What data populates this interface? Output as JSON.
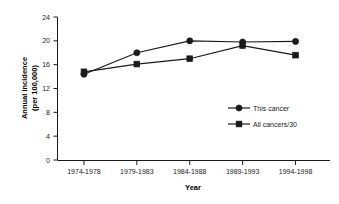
{
  "chart_data": {
    "type": "line",
    "title": "",
    "xlabel": "Year",
    "ylabel": "Annual incidence (per 100,000)",
    "ylabel_line1": "Annual incidence",
    "ylabel_line2": "(per 100,000)",
    "categories": [
      "1974-1978",
      "1979-1983",
      "1984-1988",
      "1989-1993",
      "1994-1998"
    ],
    "yticks": [
      0,
      4,
      8,
      12,
      16,
      20,
      24
    ],
    "ytick_labels": [
      "0",
      "4",
      "8",
      "12",
      "16",
      "20",
      "24"
    ],
    "ylim": [
      0,
      24
    ],
    "grid": false,
    "legend_position": "center-right",
    "series": [
      {
        "name": "This cancer",
        "marker": "circle",
        "color": "#1a1a1a",
        "values": [
          14.4,
          18.0,
          20.0,
          19.8,
          19.9
        ]
      },
      {
        "name": "All cancers/30",
        "marker": "square",
        "color": "#1a1a1a",
        "values": [
          14.8,
          16.1,
          17.0,
          19.2,
          17.6
        ]
      }
    ]
  },
  "axis": {
    "x_title": "Year",
    "y_title_line1": "Annual incidence",
    "y_title_line2": "(per 100,000)"
  },
  "legend": {
    "entries": [
      {
        "label": "This cancer",
        "marker": "circle-marker"
      },
      {
        "label": "All cancers/30",
        "marker": "square-marker"
      }
    ]
  }
}
